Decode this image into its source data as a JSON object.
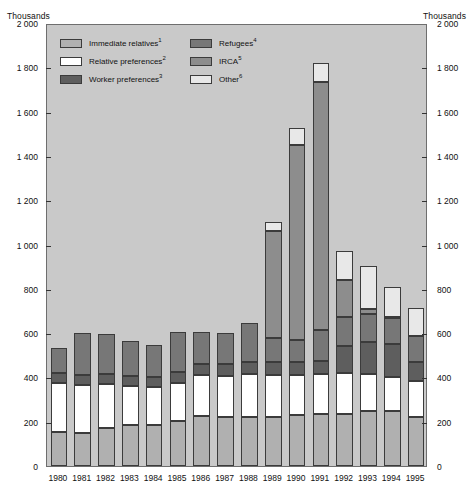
{
  "axis": {
    "unit_label_left": "Thousands",
    "unit_label_right": "Thousands",
    "ticks": [
      "2 000",
      "1 800",
      "1 600",
      "1 400",
      "1 200",
      "1 000",
      "800",
      "600",
      "400",
      "200",
      "0"
    ]
  },
  "legend": {
    "items": [
      {
        "label": "Immediate relatives",
        "note": "1",
        "color": "#b0b0b0",
        "key": "immediate_relatives"
      },
      {
        "label": "Relative preferences",
        "note": "2",
        "color": "#ffffff",
        "key": "relative_preferences"
      },
      {
        "label": "Worker preferences",
        "note": "3",
        "color": "#5e5e5e",
        "key": "worker_preferences"
      },
      {
        "label": "Refugees",
        "note": "4",
        "color": "#777777",
        "key": "refugees"
      },
      {
        "label": "IRCA",
        "note": "5",
        "color": "#8d8d8d",
        "key": "irca"
      },
      {
        "label": "Other",
        "note": "6",
        "color": "#e8e8e8",
        "key": "other"
      }
    ]
  },
  "chart_data": {
    "type": "bar",
    "stacked": true,
    "title": "",
    "xlabel": "",
    "ylabel": "Thousands",
    "ylim": [
      0,
      2000
    ],
    "ytick_step": 200,
    "grid": false,
    "legend_position": "top-left inside",
    "categories": [
      "1980",
      "1981",
      "1982",
      "1983",
      "1984",
      "1985",
      "1986",
      "1987",
      "1988",
      "1989",
      "1990",
      "1991",
      "1992",
      "1993",
      "1994",
      "1995"
    ],
    "series": [
      {
        "name": "Immediate relatives",
        "color": "#b0b0b0",
        "values": [
          155,
          150,
          170,
          185,
          185,
          205,
          225,
          220,
          220,
          220,
          230,
          235,
          235,
          250,
          250,
          220
        ]
      },
      {
        "name": "Relative preferences",
        "color": "#ffffff",
        "values": [
          220,
          215,
          200,
          175,
          170,
          170,
          185,
          185,
          195,
          190,
          180,
          180,
          185,
          165,
          150,
          165
        ]
      },
      {
        "name": "Worker preferences",
        "color": "#5e5e5e",
        "values": [
          45,
          45,
          45,
          45,
          45,
          50,
          50,
          55,
          55,
          60,
          60,
          60,
          120,
          145,
          150,
          85
        ]
      },
      {
        "name": "Refugees",
        "color": "#777777",
        "values": [
          115,
          190,
          180,
          160,
          145,
          180,
          145,
          140,
          175,
          110,
          100,
          140,
          135,
          125,
          120,
          115
        ]
      },
      {
        "name": "IRCA",
        "color": "#8d8d8d",
        "values": [
          0,
          0,
          0,
          0,
          0,
          0,
          0,
          0,
          0,
          480,
          880,
          1120,
          165,
          25,
          5,
          0
        ]
      },
      {
        "name": "Other",
        "color": "#e8e8e8",
        "values": [
          0,
          0,
          0,
          0,
          0,
          0,
          0,
          0,
          0,
          40,
          75,
          85,
          130,
          195,
          135,
          130
        ]
      }
    ],
    "totals": [
      535,
      600,
      595,
      565,
      545,
      605,
      605,
      600,
      645,
      1100,
      1525,
      1820,
      970,
      905,
      810,
      715
    ]
  }
}
